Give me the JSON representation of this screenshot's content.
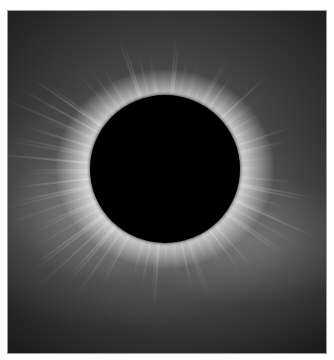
{
  "image": {
    "subject": "total solar eclipse with corona",
    "alt": "Solar corona around the dark disc of the Moon during a total solar eclipse",
    "colors": {
      "moon": "#000000",
      "corona": "#ffffff",
      "sky": "#1a1a1a",
      "border": "#9a9a9a"
    }
  }
}
